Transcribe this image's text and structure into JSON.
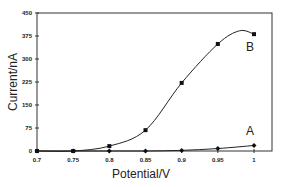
{
  "chart_data": {
    "type": "line",
    "title": "",
    "xlabel": "Potential/V",
    "ylabel": "Current/nA",
    "xlim": [
      0.7,
      1.0
    ],
    "ylim": [
      0,
      450
    ],
    "x_ticks": [
      0.7,
      0.75,
      0.8,
      0.85,
      0.9,
      0.95,
      1
    ],
    "x_tick_labels": [
      "0.7",
      "0.75",
      "0.8",
      "0.85",
      "0.9",
      "0.95",
      "1"
    ],
    "y_ticks": [
      0,
      75,
      150,
      225,
      300,
      375,
      450
    ],
    "y_tick_labels": [
      "0",
      "75",
      "150",
      "225",
      "300",
      "375",
      "450"
    ],
    "grid": false,
    "legend": "inline labels near curve ends",
    "x": [
      0.7,
      0.75,
      0.8,
      0.85,
      0.9,
      0.95,
      1.0
    ],
    "series": [
      {
        "name": "A",
        "marker": "diamond",
        "values": [
          0,
          0,
          0,
          0,
          2,
          8,
          18
        ]
      },
      {
        "name": "B",
        "marker": "square",
        "values": [
          0,
          0,
          16,
          68,
          222,
          349,
          381
        ]
      }
    ]
  },
  "labels": {
    "xlabel": "Potential/V",
    "ylabel": "Current/nA",
    "series_a": "A",
    "series_b": "B"
  }
}
